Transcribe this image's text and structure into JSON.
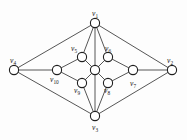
{
  "figure": {
    "type": "undirected-graph-diagram",
    "width": 187,
    "height": 140,
    "background_color": "#fdfdfd",
    "edge_color": "#2b2b2b",
    "vertex_fill_color": "#ffffff",
    "vertex_stroke_color": "#1f1f1f",
    "vertex_radius": 4.6
  },
  "vertices": [
    {
      "id": "v1",
      "label_base": "v",
      "label_sub": "1",
      "label_text": "v1",
      "x": 95,
      "y": 23,
      "label_x": 92,
      "label_y": 10,
      "labeled": true
    },
    {
      "id": "v2",
      "label_base": "v",
      "label_sub": "2",
      "label_text": "v2",
      "x": 172,
      "y": 70,
      "label_x": 167,
      "label_y": 57,
      "labeled": true
    },
    {
      "id": "v3",
      "label_base": "v",
      "label_sub": "3",
      "label_text": "v3",
      "x": 95,
      "y": 116,
      "label_x": 92,
      "label_y": 124,
      "labeled": true
    },
    {
      "id": "v4",
      "label_base": "v",
      "label_sub": "4",
      "label_text": "v4",
      "x": 14,
      "y": 70,
      "label_x": 10,
      "label_y": 57,
      "labeled": true
    },
    {
      "id": "v5",
      "label_base": "v",
      "label_sub": "5",
      "label_text": "v5",
      "x": 82,
      "y": 57,
      "label_x": 71,
      "label_y": 45,
      "labeled": true
    },
    {
      "id": "v6",
      "label_base": "v",
      "label_sub": "6",
      "label_text": "v6",
      "x": 108,
      "y": 57,
      "label_x": 105,
      "label_y": 45,
      "labeled": true
    },
    {
      "id": "v7",
      "label_base": "v",
      "label_sub": "7",
      "label_text": "v7",
      "x": 133,
      "y": 70,
      "label_x": 130,
      "label_y": 80,
      "labeled": true
    },
    {
      "id": "v8",
      "label_base": "v",
      "label_sub": "8",
      "label_text": "v8",
      "x": 108,
      "y": 83,
      "label_x": 104,
      "label_y": 87,
      "labeled": true
    },
    {
      "id": "v9",
      "label_base": "v",
      "label_sub": "9",
      "label_text": "v9",
      "x": 82,
      "y": 83,
      "label_x": 74,
      "label_y": 87,
      "labeled": true
    },
    {
      "id": "v10",
      "label_base": "v",
      "label_sub": "10",
      "label_text": "v10",
      "x": 57,
      "y": 70,
      "label_x": 50,
      "label_y": 76,
      "labeled": true
    },
    {
      "id": "vc",
      "label_base": "",
      "label_sub": "",
      "label_text": "",
      "x": 95,
      "y": 70,
      "label_x": 0,
      "label_y": 0,
      "labeled": false
    }
  ],
  "edges": [
    {
      "from": "v1",
      "to": "v4"
    },
    {
      "from": "v1",
      "to": "v2"
    },
    {
      "from": "v1",
      "to": "v5"
    },
    {
      "from": "v1",
      "to": "v6"
    },
    {
      "from": "v1",
      "to": "vc"
    },
    {
      "from": "v4",
      "to": "v3"
    },
    {
      "from": "v4",
      "to": "v10"
    },
    {
      "from": "v2",
      "to": "v3"
    },
    {
      "from": "v2",
      "to": "v7"
    },
    {
      "from": "v3",
      "to": "v9"
    },
    {
      "from": "v3",
      "to": "v8"
    },
    {
      "from": "v3",
      "to": "vc"
    },
    {
      "from": "v5",
      "to": "v10"
    },
    {
      "from": "v5",
      "to": "vc"
    },
    {
      "from": "v6",
      "to": "vc"
    },
    {
      "from": "v6",
      "to": "v7"
    },
    {
      "from": "v10",
      "to": "v9"
    },
    {
      "from": "v9",
      "to": "vc"
    },
    {
      "from": "v8",
      "to": "vc"
    },
    {
      "from": "v8",
      "to": "v7"
    }
  ]
}
